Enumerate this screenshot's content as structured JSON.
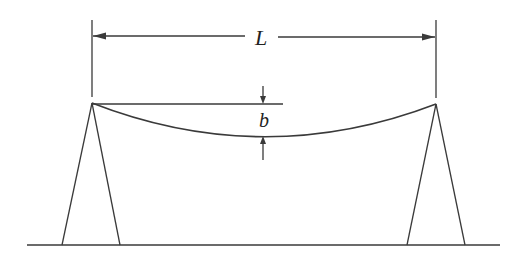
{
  "diagram": {
    "labels": {
      "span": "L",
      "sag": "b"
    },
    "colors": {
      "stroke": "#3a3a3a",
      "background": "#ffffff"
    },
    "elements": [
      {
        "name": "left-tower",
        "type": "A-frame tower"
      },
      {
        "name": "right-tower",
        "type": "A-frame tower"
      },
      {
        "name": "cable",
        "type": "sagging curve"
      },
      {
        "name": "ground",
        "type": "horizontal line"
      },
      {
        "name": "span-dimension",
        "label": "L"
      },
      {
        "name": "sag-dimension",
        "label": "b"
      }
    ]
  }
}
